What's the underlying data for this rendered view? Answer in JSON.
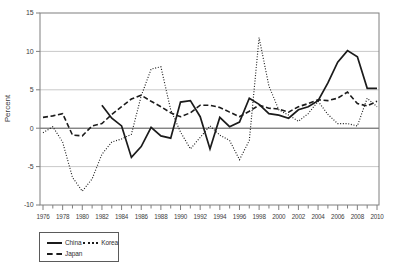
{
  "colors": {
    "line": "#1b1b1b",
    "grid": "#c9c9c9",
    "zero_line": "#4f4f4f",
    "frame": "#7f7f7f",
    "tick_label": "#404040",
    "background": "#ffffff"
  },
  "chart_data": {
    "type": "line",
    "title": "",
    "xlabel": "",
    "ylabel": "Percent",
    "x_start": 1976,
    "x_end": 2010,
    "ylim": [
      -10,
      15
    ],
    "yticks": [
      15,
      10,
      5,
      0,
      -5,
      -10
    ],
    "xtick_labels": [
      "1976",
      "1978",
      "1980",
      "1982",
      "1984",
      "1986",
      "1988",
      "1990",
      "1992",
      "1994",
      "1996",
      "1998",
      "2000",
      "2002",
      "2004",
      "2006",
      "2008",
      "2010"
    ],
    "x_minor_tick_every_year": true,
    "grid": "horizontal",
    "zero_line": true,
    "legend_position": "bottom-left",
    "series": [
      {
        "name": "China",
        "line_style": "solid",
        "start_year": 1982,
        "values": [
          3.0,
          1.3,
          0.3,
          -3.8,
          -2.4,
          0.1,
          -1.0,
          -1.3,
          3.4,
          3.6,
          1.5,
          -2.7,
          1.4,
          0.2,
          0.8,
          3.9,
          3.1,
          1.9,
          1.7,
          1.3,
          2.4,
          2.8,
          3.6,
          5.9,
          8.6,
          10.1,
          9.3,
          5.2,
          5.2
        ]
      },
      {
        "name": "Korea",
        "line_style": "dotted",
        "start_year": 1976,
        "values": [
          -0.6,
          0.2,
          -1.8,
          -6.4,
          -8.2,
          -6.6,
          -3.4,
          -1.8,
          -1.4,
          -0.8,
          4.2,
          7.7,
          8.0,
          2.4,
          -0.5,
          -2.7,
          -1.2,
          0.3,
          -0.9,
          -1.6,
          -4.1,
          -1.6,
          11.8,
          5.5,
          2.4,
          1.7,
          0.9,
          1.9,
          3.5,
          1.8,
          0.6,
          0.6,
          0.3,
          3.9,
          2.8
        ]
      },
      {
        "name": "Japan",
        "line_style": "dashed",
        "start_year": 1976,
        "values": [
          1.4,
          1.6,
          1.9,
          -0.9,
          -1.0,
          0.3,
          0.6,
          1.8,
          2.8,
          3.8,
          4.3,
          3.5,
          2.8,
          2.0,
          1.5,
          2.0,
          3.0,
          3.0,
          2.7,
          2.1,
          1.5,
          2.2,
          3.0,
          2.6,
          2.5,
          2.1,
          2.8,
          3.2,
          3.7,
          3.6,
          3.9,
          4.7,
          3.2,
          2.9,
          3.5
        ]
      }
    ]
  }
}
